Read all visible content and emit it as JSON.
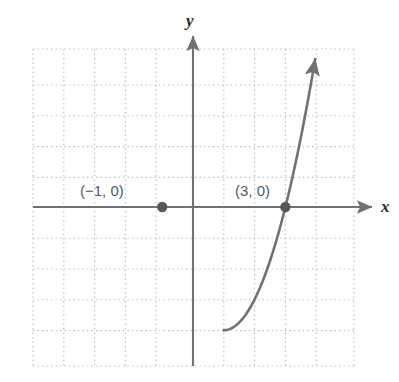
{
  "figure": {
    "width": 399,
    "height": 382,
    "background_color": "#ffffff"
  },
  "axes": {
    "x_label": "x",
    "y_label": "y",
    "axis_color": "#6e7275",
    "grid_color": "#b9bcbe",
    "grid_style": "dotted",
    "origin_px": {
      "x": 193,
      "y": 207
    },
    "unit_px": 30.8,
    "grid_bounds_px": {
      "left": 33,
      "top": 49,
      "right": 354,
      "bottom": 366
    },
    "x_range": [
      -5.2,
      5.2
    ],
    "y_range": [
      -5.2,
      5.1
    ]
  },
  "labels": {
    "root_left": "(−1, 0)",
    "root_right": "(3, 0)"
  },
  "chart_data": {
    "type": "line",
    "title": "",
    "xlabel": "x",
    "ylabel": "y",
    "grid": true,
    "legend": "none",
    "xlim": [
      -5.2,
      5.2
    ],
    "ylim": [
      -5.2,
      5.1
    ],
    "curve": {
      "name": "parabola",
      "equation": "y = x^2 - 2x - 3",
      "color": "#6e7275",
      "line_width": 2.6,
      "arrow_ends": [
        "left-up",
        "right-up"
      ],
      "vertex": [
        1,
        -4
      ],
      "x": [
        -1.6,
        -1.4,
        -1.2,
        -1.0,
        -0.8,
        -0.6,
        -0.4,
        -0.2,
        0.0,
        0.2,
        0.4,
        0.6,
        0.8,
        1.0,
        1.2,
        1.4,
        1.6,
        1.8,
        2.0,
        2.2,
        2.4,
        2.6,
        2.8,
        3.0,
        3.2,
        3.4,
        3.6
      ],
      "y": [
        2.76,
        1.76,
        0.84,
        0.0,
        -0.76,
        -1.44,
        -2.04,
        -2.56,
        -3.0,
        -3.36,
        -3.64,
        -3.84,
        -3.96,
        -4.0,
        -3.96,
        -3.84,
        -3.64,
        -3.36,
        -3.0,
        -2.56,
        -2.04,
        -1.44,
        -0.76,
        0.0,
        0.84,
        1.76,
        2.76
      ]
    },
    "points": [
      {
        "name": "root_left",
        "x": -1,
        "y": 0,
        "label": "(−1, 0)",
        "marker": "filled-circle",
        "color": "#55595c"
      },
      {
        "name": "root_right",
        "x": 3,
        "y": 0,
        "label": "(3, 0)",
        "marker": "filled-circle",
        "color": "#55595c"
      }
    ]
  }
}
